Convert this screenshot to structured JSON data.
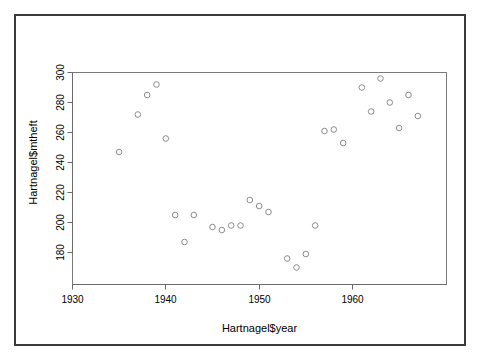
{
  "window": {
    "background_color": "#ffffff",
    "border_color": "#3a3a3a"
  },
  "chart_data": {
    "type": "scatter",
    "title": "",
    "xlabel": "Hartnagel$year",
    "ylabel": "Hartnagel$mtheft",
    "xlim": [
      1930,
      1968
    ],
    "ylim": [
      170,
      302
    ],
    "xticks": [
      1930,
      1940,
      1950,
      1960
    ],
    "yticks": [
      180,
      200,
      220,
      240,
      260,
      280,
      300
    ],
    "grid": false,
    "legend": null,
    "marker": "open-circle",
    "marker_color": "#8d8d8d",
    "x": [
      1935,
      1937,
      1938,
      1939,
      1940,
      1941,
      1942,
      1943,
      1945,
      1946,
      1947,
      1948,
      1949,
      1950,
      1951,
      1953,
      1954,
      1955,
      1956,
      1957,
      1958,
      1959,
      1961,
      1962,
      1963,
      1964,
      1965,
      1966,
      1967
    ],
    "y": [
      247,
      272,
      285,
      292,
      256,
      205,
      187,
      205,
      197,
      195,
      198,
      198,
      215,
      211,
      207,
      176,
      170,
      179,
      198,
      261,
      262,
      253,
      290,
      274,
      296,
      280,
      263,
      285,
      271
    ],
    "points": [
      {
        "x": 1935,
        "y": 247
      },
      {
        "x": 1937,
        "y": 272
      },
      {
        "x": 1938,
        "y": 285
      },
      {
        "x": 1939,
        "y": 292
      },
      {
        "x": 1940,
        "y": 256
      },
      {
        "x": 1941,
        "y": 205
      },
      {
        "x": 1942,
        "y": 187
      },
      {
        "x": 1943,
        "y": 205
      },
      {
        "x": 1945,
        "y": 197
      },
      {
        "x": 1946,
        "y": 195
      },
      {
        "x": 1947,
        "y": 198
      },
      {
        "x": 1948,
        "y": 198
      },
      {
        "x": 1949,
        "y": 215
      },
      {
        "x": 1950,
        "y": 211
      },
      {
        "x": 1951,
        "y": 207
      },
      {
        "x": 1953,
        "y": 176
      },
      {
        "x": 1954,
        "y": 170
      },
      {
        "x": 1955,
        "y": 179
      },
      {
        "x": 1956,
        "y": 198
      },
      {
        "x": 1957,
        "y": 261
      },
      {
        "x": 1958,
        "y": 262
      },
      {
        "x": 1959,
        "y": 253
      },
      {
        "x": 1961,
        "y": 290
      },
      {
        "x": 1962,
        "y": 274
      },
      {
        "x": 1963,
        "y": 296
      },
      {
        "x": 1964,
        "y": 280
      },
      {
        "x": 1965,
        "y": 263
      },
      {
        "x": 1966,
        "y": 285
      },
      {
        "x": 1967,
        "y": 271
      }
    ]
  }
}
